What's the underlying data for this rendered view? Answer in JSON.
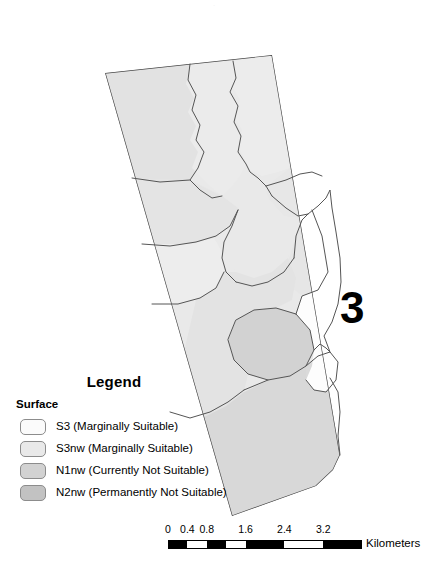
{
  "figure": {
    "number_label": "3",
    "background_color": "#ffffff",
    "top_artifact_text": "."
  },
  "legend": {
    "title": "Legend",
    "group_title": "Surface",
    "items": [
      {
        "code": "S3",
        "label": "S3 (Marginally Suitable)",
        "color": "#fbfbfb",
        "border": "#8c8c8c"
      },
      {
        "code": "S3nw",
        "label": "S3nw (Marginally Suitable)",
        "color": "#e9e9e9",
        "border": "#8c8c8c"
      },
      {
        "code": "N1nw",
        "label": "N1nw (Currently Not Suitable)",
        "color": "#d2d2d2",
        "border": "#8c8c8c"
      },
      {
        "code": "N2nw",
        "label": "N2nw (Permanently Not Suitable)",
        "color": "#c2c2c2",
        "border": "#8c8c8c"
      }
    ]
  },
  "scalebar": {
    "units": "Kilometers",
    "tick_labels": [
      "0",
      "0.4",
      "0.8",
      "1.6",
      "2.4",
      "3.2"
    ],
    "tick_values": [
      0,
      0.4,
      0.8,
      1.6,
      2.4,
      3.2
    ],
    "max_value": 3.2,
    "segments": [
      {
        "from": 0.0,
        "to": 0.4,
        "fill": "#000000"
      },
      {
        "from": 0.4,
        "to": 0.8,
        "fill": "#ffffff"
      },
      {
        "from": 0.8,
        "to": 1.2,
        "fill": "#000000"
      },
      {
        "from": 1.2,
        "to": 1.6,
        "fill": "#ffffff"
      },
      {
        "from": 1.6,
        "to": 2.4,
        "fill": "#000000"
      },
      {
        "from": 2.4,
        "to": 3.2,
        "fill": "#ffffff"
      },
      {
        "from": 3.2,
        "to": 4.0,
        "fill": "#000000"
      }
    ]
  },
  "map": {
    "outline_color": "#4a4a4a",
    "polygon_stroke": "#555555",
    "classes": {
      "S3": "#fbfbfb",
      "S3nw": "#e9e9e9",
      "N1nw": "#d2d2d2",
      "N2nw": "#c2c2c2"
    },
    "regions": [
      {
        "name": "north-west-block",
        "class": "S3nw"
      },
      {
        "name": "north-central-band",
        "class": "S3nw"
      },
      {
        "name": "north-east-block",
        "class": "S3nw"
      },
      {
        "name": "upper-mid-west",
        "class": "S3nw"
      },
      {
        "name": "upper-mid-east",
        "class": "S3nw"
      },
      {
        "name": "mid-central",
        "class": "S3nw"
      },
      {
        "name": "mid-west",
        "class": "S3nw"
      },
      {
        "name": "mid-east",
        "class": "S3nw"
      },
      {
        "name": "lower-mid-core",
        "class": "N1nw"
      },
      {
        "name": "south-main",
        "class": "S3nw"
      },
      {
        "name": "south-east-spit",
        "class": "S3nw"
      },
      {
        "name": "water-inlet",
        "class": "S3"
      }
    ]
  }
}
